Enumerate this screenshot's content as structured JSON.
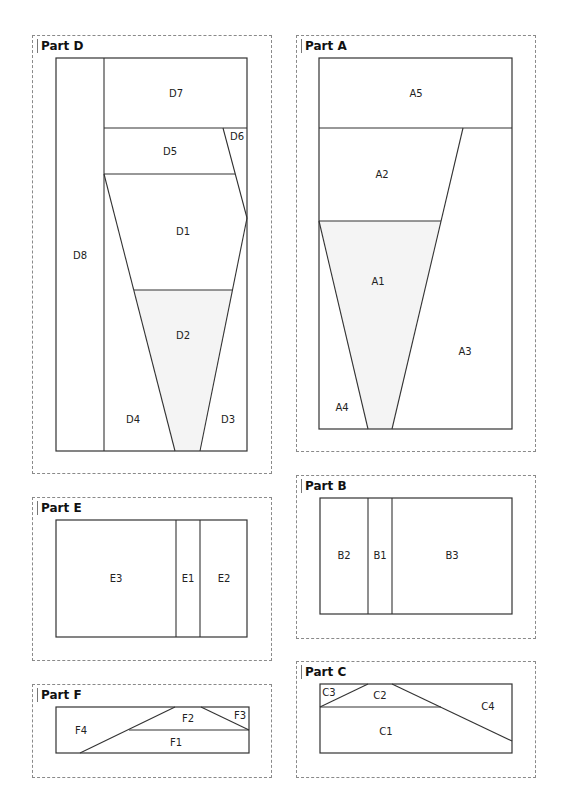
{
  "parts": {
    "D": {
      "title": "Part D",
      "labels": {
        "D1": "D1",
        "D2": "D2",
        "D3": "D3",
        "D4": "D4",
        "D5": "D5",
        "D6": "D6",
        "D7": "D7",
        "D8": "D8"
      }
    },
    "A": {
      "title": "Part A",
      "labels": {
        "A1": "A1",
        "A2": "A2",
        "A3": "A3",
        "A4": "A4",
        "A5": "A5"
      }
    },
    "E": {
      "title": "Part E",
      "labels": {
        "E1": "E1",
        "E2": "E2",
        "E3": "E3"
      }
    },
    "B": {
      "title": "Part B",
      "labels": {
        "B1": "B1",
        "B2": "B2",
        "B3": "B3"
      }
    },
    "F": {
      "title": "Part F",
      "labels": {
        "F1": "F1",
        "F2": "F2",
        "F3": "F3",
        "F4": "F4"
      }
    },
    "C": {
      "title": "Part C",
      "labels": {
        "C1": "C1",
        "C2": "C2",
        "C3": "C3",
        "C4": "C4"
      }
    }
  },
  "colors": {
    "line": "#333333",
    "dashed_border": "#8a8a8a",
    "center_piece_fill": "#f4f4f4"
  }
}
